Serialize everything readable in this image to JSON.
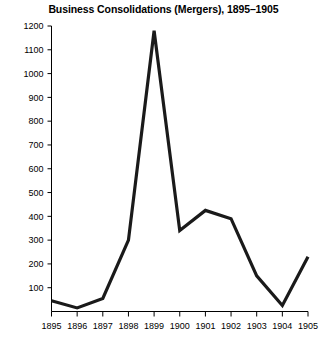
{
  "chart_data": {
    "type": "line",
    "title": "Business Consolidations (Mergers), 1895–1905",
    "xlabel": "",
    "ylabel": "",
    "categories": [
      "1895",
      "1896",
      "1897",
      "1898",
      "1899",
      "1900",
      "1901",
      "1902",
      "1903",
      "1904",
      "1905"
    ],
    "values": [
      45,
      15,
      55,
      300,
      1180,
      340,
      425,
      390,
      150,
      25,
      230
    ],
    "series": [
      {
        "name": "Business consolidations (mergers)",
        "values": [
          45,
          15,
          55,
          300,
          1180,
          340,
          425,
          390,
          150,
          25,
          230
        ]
      }
    ],
    "x": [
      1895,
      1896,
      1897,
      1898,
      1899,
      1900,
      1901,
      1902,
      1903,
      1904,
      1905
    ],
    "ylim": [
      0,
      1200
    ],
    "xlim": [
      1895,
      1905
    ],
    "yticks": [
      0,
      100,
      200,
      300,
      400,
      500,
      600,
      700,
      800,
      900,
      1000,
      1100,
      1200
    ],
    "ytick_labels": [
      "",
      "100",
      "200",
      "300",
      "400",
      "500",
      "600",
      "700",
      "800",
      "900",
      "1000",
      "1100",
      "1200"
    ],
    "xticks": [
      1895,
      1896,
      1897,
      1898,
      1899,
      1900,
      1901,
      1902,
      1903,
      1904,
      1905
    ],
    "xtick_labels": [
      "1895",
      "1896",
      "1897",
      "1898",
      "1899",
      "1900",
      "1901",
      "1902",
      "1903",
      "1904",
      "1905"
    ],
    "grid": false,
    "legend": false,
    "legend_position": "none",
    "line_color": "#1a1a1a",
    "background_color": "#ffffff",
    "annotations": []
  }
}
